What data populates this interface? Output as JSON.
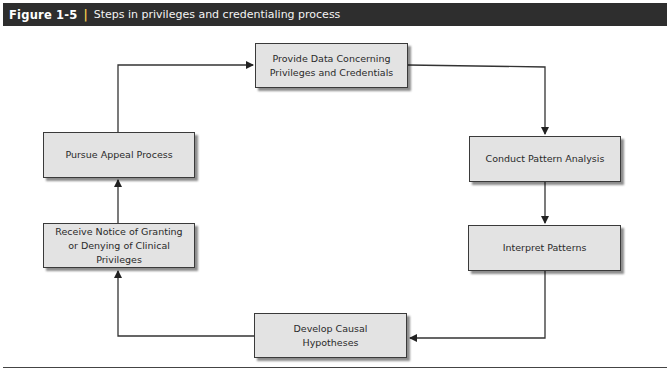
{
  "figure": {
    "number": "Figure 1-5",
    "separator": "|",
    "caption": "Steps in privileges and credentialing process",
    "header_bg": "#2e2e2e",
    "box_fill": "#e3e3e3"
  },
  "steps": [
    {
      "id": "provide-data",
      "label": "Provide Data Concerning Privileges and Credentials"
    },
    {
      "id": "conduct-pattern-analysis",
      "label": "Conduct Pattern Analysis"
    },
    {
      "id": "interpret-patterns",
      "label": "Interpret Patterns"
    },
    {
      "id": "develop-causal-hypotheses",
      "label": "Develop Causal Hypotheses"
    },
    {
      "id": "receive-notice",
      "label": "Receive Notice of Granting or Denying of Clinical Privileges"
    },
    {
      "id": "pursue-appeal",
      "label": "Pursue Appeal Process"
    }
  ],
  "flow": [
    [
      "provide-data",
      "conduct-pattern-analysis"
    ],
    [
      "conduct-pattern-analysis",
      "interpret-patterns"
    ],
    [
      "interpret-patterns",
      "develop-causal-hypotheses"
    ],
    [
      "develop-causal-hypotheses",
      "receive-notice"
    ],
    [
      "receive-notice",
      "pursue-appeal"
    ],
    [
      "pursue-appeal",
      "provide-data"
    ]
  ]
}
